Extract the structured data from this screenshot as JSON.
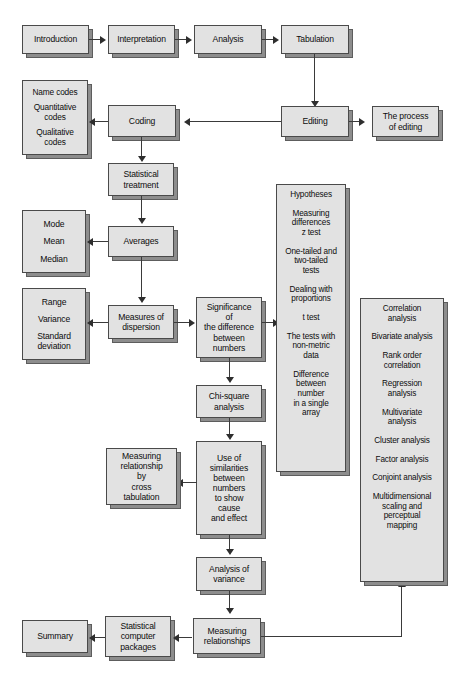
{
  "diagram": {
    "style": {
      "box_fill": "#e2e2e2",
      "box_border": "#4a4a4a",
      "shadow": "#5d5d5d",
      "connector": "#3a3a3a",
      "background": "#ffffff"
    },
    "nodes": {
      "introduction": "Introduction",
      "interpretation": "Interpretation",
      "analysis": "Analysis",
      "tabulation": "Tabulation",
      "editing": "Editing",
      "process_of_editing_l1": "The process",
      "process_of_editing_l2": "of editing",
      "coding": "Coding",
      "name_codes_1": "Name codes",
      "name_codes_2": "Quantitative codes",
      "name_codes_3": "Qualitative codes",
      "statistical_treatment_l1": "Statistical",
      "statistical_treatment_l2": "treatment",
      "averages": "Averages",
      "mode": "Mode",
      "mean": "Mean",
      "median": "Median",
      "measures_of_dispersion_l1": "Measures of",
      "measures_of_dispersion_l2": "dispersion",
      "range": "Range",
      "variance": "Variance",
      "standard_deviation": "Standard deviation",
      "significance_l1": "Significance",
      "significance_l2": "of",
      "significance_l3": "the difference",
      "significance_l4": "between",
      "significance_l5": "numbers",
      "chi_square_l1": "Chi-square",
      "chi_square_l2": "analysis",
      "use_of_similarities_l1": "Use of",
      "use_of_similarities_l2": "similarities",
      "use_of_similarities_l3": "between",
      "use_of_similarities_l4": "numbers",
      "use_of_similarities_l5": "to show",
      "use_of_similarities_l6": "cause",
      "use_of_similarities_l7": "and effect",
      "cross_tabulation_l1": "Measuring",
      "cross_tabulation_l2": "relationship",
      "cross_tabulation_l3": "by",
      "cross_tabulation_l4": "cross",
      "cross_tabulation_l5": "tabulation",
      "analysis_of_variance_l1": "Analysis of",
      "analysis_of_variance_l2": "variance",
      "measuring_relationships_l1": "Measuring",
      "measuring_relationships_l2": "relationships",
      "statistical_computer_packages_l1": "Statistical",
      "statistical_computer_packages_l2": "computer",
      "statistical_computer_packages_l3": "packages",
      "summary": "Summary"
    },
    "hypotheses_panel": {
      "heading": "Hypotheses",
      "items": [
        "Measuring differences z test",
        "One-tailed and two-tailed tests",
        "Dealing with proportions",
        "t test",
        "The tests with non-metric data",
        "Difference between number in a single array"
      ],
      "items_lines": [
        [
          "Measuring",
          "differences",
          "z test"
        ],
        [
          "One-tailed and",
          "two-tailed",
          "tests"
        ],
        [
          "Dealing with",
          "proportions"
        ],
        [
          "t test"
        ],
        [
          "The tests with",
          "non-metric",
          "data"
        ],
        [
          "Difference",
          "between",
          "number",
          "in a single",
          "array"
        ]
      ]
    },
    "correlation_panel": {
      "heading_lines": [
        "Correlation",
        "analysis"
      ],
      "items": [
        "Bivariate analysis",
        "Rank order correlation",
        "Regression analysis",
        "Multivariate analysis",
        "Cluster analysis",
        "Factor analysis",
        "Conjoint analysis",
        "Multidimensional scaling and perceptual mapping"
      ],
      "items_lines": [
        [
          "Bivariate analysis"
        ],
        [
          "Rank order",
          "correlation"
        ],
        [
          "Regression",
          "analysis"
        ],
        [
          "Multivariate",
          "analysis"
        ],
        [
          "Cluster analysis"
        ],
        [
          "Factor analysis"
        ],
        [
          "Conjoint analysis"
        ],
        [
          "Multidimensional",
          "scaling and",
          "perceptual",
          "mapping"
        ]
      ]
    }
  }
}
